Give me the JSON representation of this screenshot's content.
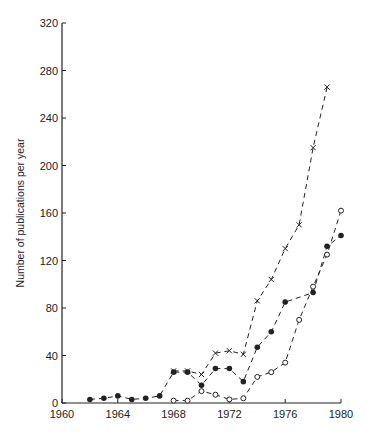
{
  "chart_data": {
    "type": "line",
    "title": "",
    "xlabel": "",
    "ylabel": "Number of publications per year",
    "xlim": [
      1960,
      1980
    ],
    "ylim": [
      0,
      320
    ],
    "x_ticks": [
      1960,
      1964,
      1968,
      1972,
      1976,
      1980
    ],
    "y_ticks": [
      0,
      40,
      80,
      120,
      160,
      200,
      240,
      280,
      320
    ],
    "grid": false,
    "legend": null,
    "series": [
      {
        "name": "crosses",
        "marker": "x",
        "line": "dashed",
        "x": [
          1968,
          1969,
          1970,
          1971,
          1972,
          1973,
          1974,
          1975,
          1976,
          1977,
          1978,
          1979
        ],
        "values": [
          27,
          27,
          24,
          42,
          44,
          41,
          86,
          104,
          130,
          150,
          215,
          266
        ]
      },
      {
        "name": "filled circles",
        "marker": "filled-circle",
        "line": "dashed",
        "x": [
          1962,
          1963,
          1964,
          1965,
          1966,
          1967,
          1968,
          1969,
          1970,
          1971,
          1972,
          1973,
          1974,
          1975,
          1976,
          1978,
          1979,
          1980
        ],
        "values": [
          3,
          4,
          6,
          3,
          4,
          6,
          26,
          26,
          15,
          29,
          29,
          18,
          47,
          60,
          85,
          93,
          132,
          141
        ]
      },
      {
        "name": "open circles",
        "marker": "open-circle",
        "line": "dashed",
        "x": [
          1968,
          1969,
          1970,
          1971,
          1972,
          1973,
          1974,
          1975,
          1976,
          1977,
          1978,
          1979,
          1980
        ],
        "values": [
          2,
          2,
          10,
          7,
          3,
          4,
          22,
          26,
          34,
          70,
          98,
          125,
          162
        ]
      }
    ]
  }
}
